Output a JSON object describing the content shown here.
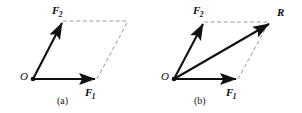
{
  "figure": {
    "background_color": "#ffffff",
    "stroke_color": "#101010",
    "dashed_color": "#9a9a9a",
    "width": 302,
    "height": 113,
    "panels": [
      {
        "id": "a",
        "caption": "(a)",
        "caption_pos": [
          58,
          97
        ],
        "origin": {
          "label": "O",
          "label_pos": [
            20,
            72
          ],
          "point": [
            33,
            79
          ]
        },
        "vectors": [
          {
            "name": "F2",
            "label": "F",
            "subscript": "2",
            "label_pos": [
              52,
              6
            ],
            "from": [
              33,
              79
            ],
            "to": [
              63,
              21
            ],
            "style": "solid"
          },
          {
            "name": "F1",
            "label": "F",
            "subscript": "1",
            "label_pos": [
              85,
              88
            ],
            "from": [
              33,
              79
            ],
            "to": [
              97,
              79
            ],
            "style": "solid"
          }
        ],
        "dashed_edges": [
          {
            "from": [
              63,
              21
            ],
            "to": [
              128,
              21
            ]
          },
          {
            "from": [
              97,
              79
            ],
            "to": [
              128,
              21
            ]
          }
        ]
      },
      {
        "id": "b",
        "caption": "(b)",
        "caption_pos": [
          195,
          97
        ],
        "origin": {
          "label": "O",
          "label_pos": [
            161,
            72
          ],
          "point": [
            174,
            79
          ]
        },
        "vectors": [
          {
            "name": "F2",
            "label": "F",
            "subscript": "2",
            "label_pos": [
              193,
              6
            ],
            "from": [
              174,
              79
            ],
            "to": [
              204,
              22
            ],
            "style": "solid"
          },
          {
            "name": "F1",
            "label": "F",
            "subscript": "1",
            "label_pos": [
              226,
              88
            ],
            "from": [
              174,
              79
            ],
            "to": [
              238,
              79
            ],
            "style": "solid"
          },
          {
            "name": "R",
            "label": "R",
            "subscript": "",
            "label_pos": [
              277,
              8
            ],
            "from": [
              174,
              79
            ],
            "to": [
              271,
              23
            ],
            "style": "solid"
          }
        ],
        "dashed_edges": [
          {
            "from": [
              204,
              22
            ],
            "to": [
              269,
              22
            ]
          },
          {
            "from": [
              238,
              79
            ],
            "to": [
              269,
              22
            ]
          }
        ]
      }
    ]
  }
}
